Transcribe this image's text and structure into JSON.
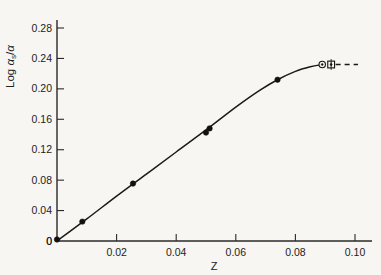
{
  "figure": {
    "background_color": "#f7f6f2",
    "ink_color": "#1a1a1a",
    "y_axis_title_parts": {
      "prefix": "Log ",
      "alpha": "α",
      "subscript": "s",
      "divider": "/",
      "alpha2": "α"
    },
    "y_axis_title_plain": "Log αs/α",
    "x_axis_title": "Z"
  },
  "chart_data": {
    "type": "scatter",
    "title": "",
    "xlabel": "Z",
    "ylabel": "Log αs/α",
    "xlim": [
      0,
      0.108
    ],
    "ylim": [
      0,
      0.3
    ],
    "grid": false,
    "legend": "none",
    "xticks": [
      0,
      0.02,
      0.04,
      0.06,
      0.08,
      0.1
    ],
    "xtick_labels": [
      "0",
      "0.02",
      "0.04",
      "0.06",
      "0.08",
      "0.10"
    ],
    "yticks": [
      0,
      0.04,
      0.08,
      0.12,
      0.16,
      0.2,
      0.24,
      0.28
    ],
    "ytick_labels": [
      "0",
      "0.04",
      "0.08",
      "0.12",
      "0.16",
      "0.20",
      "0.24",
      "0.28"
    ],
    "series": [
      {
        "name": "filled-circles",
        "marker": "filled-circle",
        "x": [
          0.0,
          0.0085,
          0.0255,
          0.05,
          0.0512,
          0.074
        ],
        "y": [
          0.002,
          0.0255,
          0.0755,
          0.1425,
          0.148,
          0.212
        ]
      },
      {
        "name": "open-circle",
        "marker": "open-circle",
        "x": [
          0.089
        ],
        "y": [
          0.232
        ]
      },
      {
        "name": "open-square",
        "marker": "open-square-with-bar",
        "x": [
          0.092
        ],
        "y": [
          0.232
        ]
      }
    ],
    "fitted_curve": {
      "name": "fitted-curve",
      "style": "solid",
      "x": [
        0.0,
        0.01,
        0.02,
        0.03,
        0.04,
        0.05,
        0.06,
        0.068,
        0.074,
        0.08,
        0.085,
        0.089
      ],
      "y": [
        0.0,
        0.029,
        0.059,
        0.088,
        0.117,
        0.146,
        0.176,
        0.198,
        0.212,
        0.223,
        0.229,
        0.232
      ]
    },
    "extrapolation": {
      "name": "dashed-extrapolation",
      "style": "dashed",
      "x": [
        0.0935,
        0.101
      ],
      "y": [
        0.232,
        0.232
      ]
    }
  }
}
